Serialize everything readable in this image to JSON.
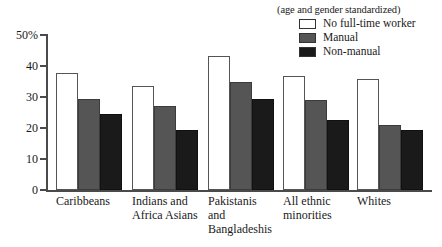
{
  "legend": {
    "note": "(age and gender standardized)",
    "entries": [
      {
        "label": "No full-time worker",
        "color": "#ffffff",
        "swatch_name": "legend-swatch-no-full-time-worker"
      },
      {
        "label": "Manual",
        "color": "#555555",
        "swatch_name": "legend-swatch-manual"
      },
      {
        "label": "Non-manual",
        "color": "#1a1a1a",
        "swatch_name": "legend-swatch-non-manual"
      }
    ]
  },
  "axis": {
    "y_ticks": [
      "50%",
      "40",
      "30",
      "20",
      "10",
      "0"
    ],
    "y_tick_values": [
      50,
      40,
      30,
      20,
      10,
      0
    ]
  },
  "chart_data": {
    "type": "bar",
    "title": "",
    "subtitle": "(age and gender standardized)",
    "xlabel": "",
    "ylabel": "",
    "ylim": [
      0,
      50
    ],
    "ytick_labels": [
      "0",
      "10",
      "20",
      "30",
      "40",
      "50%"
    ],
    "grid": false,
    "legend_position": "top-right",
    "categories": [
      "Caribbeans",
      "Indians and\nAfrica Asians",
      "Pakistanis\nand\nBangladeshis",
      "All ethnic\nminorities",
      "Whites"
    ],
    "series": [
      {
        "name": "No full-time worker",
        "color": "#ffffff",
        "values": [
          37.8,
          33.7,
          43.1,
          36.9,
          35.7
        ]
      },
      {
        "name": "Manual",
        "color": "#555555",
        "values": [
          29.3,
          27.0,
          34.7,
          29.1,
          20.9
        ]
      },
      {
        "name": "Non-manual",
        "color": "#1a1a1a",
        "values": [
          24.6,
          19.3,
          29.4,
          22.7,
          19.3
        ]
      }
    ]
  }
}
